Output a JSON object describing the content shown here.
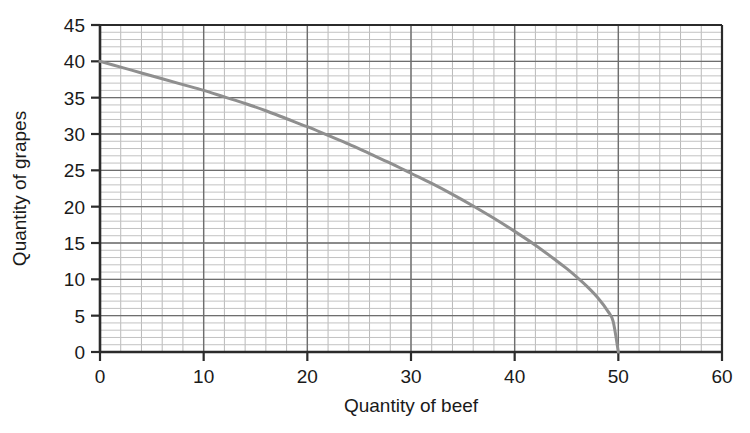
{
  "chart_data": {
    "type": "line",
    "title": "",
    "subtitle": "",
    "xlabel": "Quantity of beef",
    "ylabel": "Quantity of grapes",
    "xlim": [
      0,
      60
    ],
    "ylim": [
      0,
      45
    ],
    "xticks": [
      0,
      10,
      20,
      30,
      40,
      50,
      60
    ],
    "yticks": [
      0,
      5,
      10,
      15,
      20,
      25,
      30,
      35,
      40,
      45
    ],
    "xtick_labels": [
      "0",
      "10",
      "20",
      "30",
      "40",
      "50",
      "60"
    ],
    "ytick_labels": [
      "0",
      "5",
      "10",
      "15",
      "20",
      "25",
      "30",
      "35",
      "40",
      "45"
    ],
    "grid": true,
    "grid_major_step_x": 10,
    "grid_major_step_y": 5,
    "grid_minor_step_x": 2,
    "grid_minor_step_y": 1,
    "legend": null,
    "legend_position": "none",
    "annotations": [],
    "series": [
      {
        "name": "Production possibility frontier",
        "color": "#8f8f8f",
        "line_width": 3,
        "x": [
          0,
          2,
          4,
          6,
          8,
          10,
          12,
          14,
          16,
          18,
          20,
          22,
          24,
          26,
          28,
          30,
          32,
          34,
          36,
          38,
          40,
          42,
          44,
          45,
          46,
          47,
          48,
          49,
          49.5,
          50
        ],
        "values": [
          40.0,
          39.2,
          38.4,
          37.6,
          36.8,
          36.0,
          35.1,
          34.2,
          33.2,
          32.1,
          31.0,
          29.8,
          28.6,
          27.3,
          26.0,
          24.6,
          23.2,
          21.7,
          20.1,
          18.4,
          16.6,
          14.7,
          12.6,
          11.5,
          10.3,
          9.0,
          7.5,
          5.6,
          4.2,
          0.0
        ]
      }
    ]
  },
  "axes": {
    "x_axis_name": "x-axis",
    "y_axis_name": "y-axis"
  }
}
